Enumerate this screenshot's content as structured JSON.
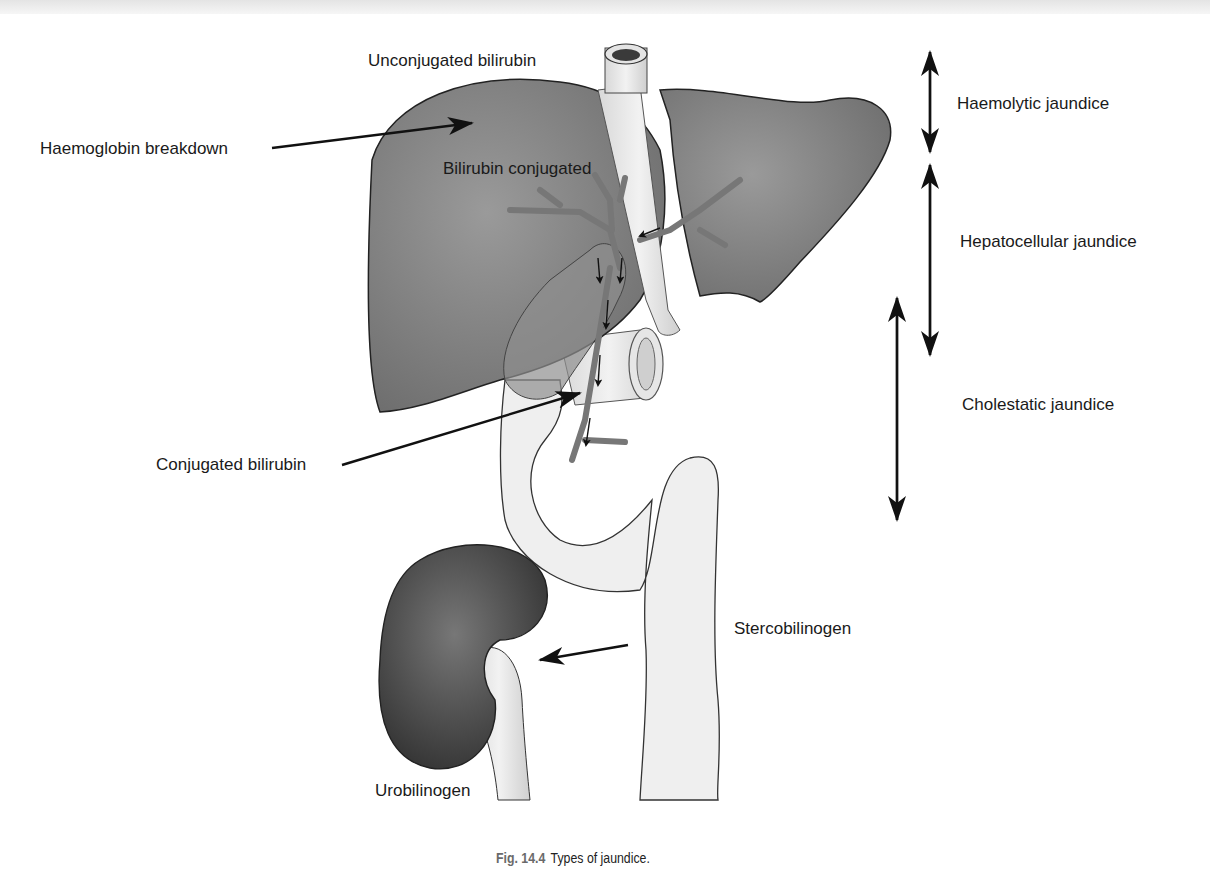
{
  "figure": {
    "labels": {
      "unconjugated": "Unconjugated bilirubin",
      "haemoglobin": "Haemoglobin breakdown",
      "bilirubin_conjugated": "Bilirubin conjugated",
      "conjugated": "Conjugated bilirubin",
      "stercobilinogen": "Stercobilinogen",
      "urobilinogen": "Urobilinogen"
    },
    "jaundice_types": [
      {
        "label": "Haemolytic jaundice"
      },
      {
        "label": "Hepatocellular jaundice"
      },
      {
        "label": "Cholestatic jaundice"
      }
    ],
    "caption": {
      "number": "Fig. 14.4",
      "text": "Types of jaundice."
    }
  },
  "colors": {
    "liver": "#8a8a8a",
    "kidney": "#4a4a4a",
    "gut": "#ececec",
    "duct": "#7a7a7a"
  }
}
